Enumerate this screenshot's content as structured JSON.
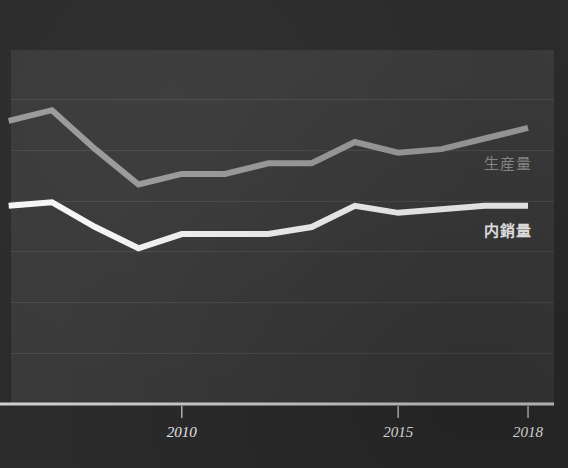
{
  "chart_data": {
    "type": "line",
    "title": "",
    "subtitle": "",
    "xlabel": "",
    "ylabel": "",
    "grid": true,
    "legend_position": "inline-right",
    "xlim": [
      2005.8,
      2018.6
    ],
    "ylim": [
      0,
      100
    ],
    "xticks": [
      2010,
      2015,
      2018
    ],
    "xtick_labels": [
      "2010",
      "2015",
      "2018"
    ],
    "yticks": [],
    "ytick_labels": [],
    "gridline_count": 6,
    "x": [
      2006,
      2007,
      2008,
      2009,
      2010,
      2011,
      2012,
      2013,
      2014,
      2015,
      2016,
      2017,
      2018
    ],
    "series": [
      {
        "name": "生産量",
        "color": "#9a9a9a",
        "values": [
          80,
          83,
          72,
          62,
          65,
          65,
          68,
          68,
          74,
          71,
          72,
          75,
          78
        ]
      },
      {
        "name": "内銷量",
        "color": "#f5f5f5",
        "values": [
          56,
          57,
          50,
          44,
          48,
          48,
          48,
          50,
          56,
          54,
          55,
          56,
          56
        ]
      }
    ],
    "annotations": []
  },
  "legend": {
    "production": "生産量",
    "domestic": "内銷量"
  },
  "axis": {
    "tick_2010": "2010",
    "tick_2015": "2015",
    "tick_2018": "2018"
  },
  "colors": {
    "background": "#2b2b2b",
    "plot_background": "#3a3a3a",
    "gridline": "#4a4a4a",
    "axis": "#cfcfcf",
    "production_line": "#9a9a9a",
    "domestic_line": "#f5f5f5",
    "tick_text": "#f0f0f0"
  }
}
